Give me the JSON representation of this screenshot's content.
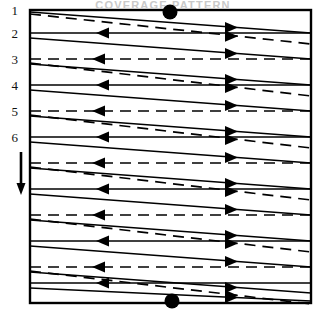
{
  "figure": {
    "kind": "boustrophedon-coverage-path-diagram",
    "title_partial": "COVERAGE PATTERN",
    "background_color": "#ffffff",
    "stroke_color": "#000000",
    "field": {
      "left": 30,
      "top": 10,
      "right": 311,
      "bottom": 303,
      "border_width": 2.4
    },
    "level_labels": [
      {
        "text": "1",
        "x": 14,
        "y": 10
      },
      {
        "text": "2",
        "x": 14,
        "y": 33
      },
      {
        "text": "3",
        "x": 14,
        "y": 59
      },
      {
        "text": "4",
        "x": 14,
        "y": 85
      },
      {
        "text": "5",
        "x": 14,
        "y": 111
      },
      {
        "text": "6",
        "x": 14,
        "y": 137
      }
    ],
    "direction_arrow": {
      "name": "downward-depth-arrow",
      "x": 21,
      "y_start": 152,
      "y_end": 195,
      "head_width": 9,
      "head_length": 12,
      "shaft_width": 2.6
    },
    "entry_marker": {
      "cx": 170,
      "cy": 12,
      "r": 7.5
    },
    "exit_marker": {
      "cx": 172,
      "cy": 301,
      "r": 7.5
    },
    "horizontal_rows": [
      {
        "y": 33,
        "style": "solid",
        "arrow_x": 96,
        "arrow_dir": "left"
      },
      {
        "y": 59,
        "style": "dashed",
        "arrow_x": 92,
        "arrow_dir": "left"
      },
      {
        "y": 85,
        "style": "solid",
        "arrow_x": 96,
        "arrow_dir": "left"
      },
      {
        "y": 111,
        "style": "dashed",
        "arrow_x": 92,
        "arrow_dir": "left"
      },
      {
        "y": 137,
        "style": "solid",
        "arrow_x": 96,
        "arrow_dir": "left"
      },
      {
        "y": 163,
        "style": "dashed",
        "arrow_x": 92,
        "arrow_dir": "left"
      },
      {
        "y": 189,
        "style": "solid",
        "arrow_x": 96,
        "arrow_dir": "left"
      },
      {
        "y": 215,
        "style": "dashed",
        "arrow_x": 92,
        "arrow_dir": "left"
      },
      {
        "y": 241,
        "style": "solid",
        "arrow_x": 96,
        "arrow_dir": "left"
      },
      {
        "y": 267,
        "style": "dashed",
        "arrow_x": 92,
        "arrow_dir": "left"
      },
      {
        "y": 283,
        "style": "solid",
        "arrow_x": 96,
        "arrow_dir": "left"
      }
    ],
    "diagonal_solid": [
      {
        "y1": 12,
        "y2": 33,
        "arrow_x": 238,
        "arrow_dir": "right"
      },
      {
        "y1": 38,
        "y2": 59,
        "arrow_x": 238,
        "arrow_dir": "right"
      },
      {
        "y1": 64,
        "y2": 85,
        "arrow_x": 238,
        "arrow_dir": "right"
      },
      {
        "y1": 90,
        "y2": 111,
        "arrow_x": 238,
        "arrow_dir": "right"
      },
      {
        "y1": 116,
        "y2": 137,
        "arrow_x": 238,
        "arrow_dir": "right"
      },
      {
        "y1": 142,
        "y2": 163,
        "arrow_x": 238,
        "arrow_dir": "right"
      },
      {
        "y1": 168,
        "y2": 189,
        "arrow_x": 238,
        "arrow_dir": "right"
      },
      {
        "y1": 194,
        "y2": 215,
        "arrow_x": 238,
        "arrow_dir": "right"
      },
      {
        "y1": 220,
        "y2": 241,
        "arrow_x": 238,
        "arrow_dir": "right"
      },
      {
        "y1": 246,
        "y2": 267,
        "arrow_x": 238,
        "arrow_dir": "right"
      },
      {
        "y1": 272,
        "y2": 293,
        "arrow_x": 238,
        "arrow_dir": "right"
      },
      {
        "y1": 288,
        "y2": 301,
        "arrow_x": 238,
        "arrow_dir": "right"
      }
    ],
    "diagonal_dashed": [
      {
        "y1": 14,
        "y2": 44,
        "arrow_x": 238,
        "arrow_dir": "right"
      },
      {
        "y1": 63,
        "y2": 96,
        "arrow_x": 238,
        "arrow_dir": "right"
      },
      {
        "y1": 115,
        "y2": 148,
        "arrow_x": 238,
        "arrow_dir": "right"
      },
      {
        "y1": 167,
        "y2": 200,
        "arrow_x": 238,
        "arrow_dir": "right"
      },
      {
        "y1": 219,
        "y2": 252,
        "arrow_x": 238,
        "arrow_dir": "right"
      },
      {
        "y1": 271,
        "y2": 304,
        "arrow_x": 238,
        "arrow_dir": "right"
      }
    ],
    "style_legend": {
      "solid_meaning": "forward-swath-track",
      "dashed_meaning": "return-swath-track"
    }
  }
}
